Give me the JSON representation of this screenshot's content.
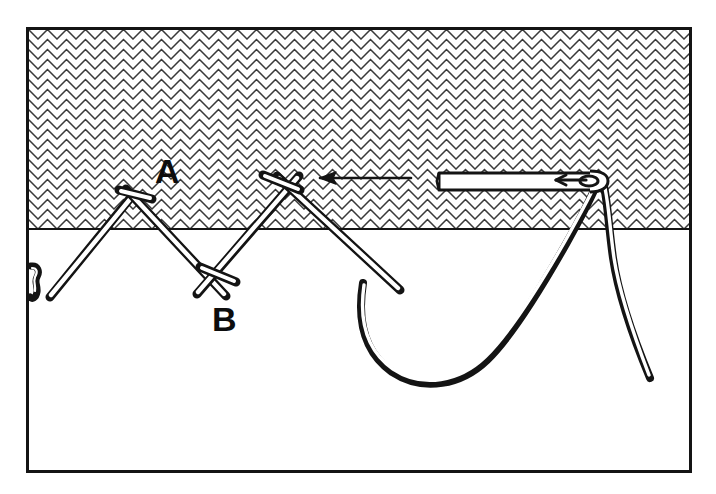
{
  "page": {
    "running_head": "STITCHES",
    "background_color": "#ffffff",
    "ink_color": "#141414",
    "rule_color": "#9a9a9a"
  },
  "figure": {
    "frame": {
      "x": 26,
      "y": 27,
      "width": 666,
      "height": 446,
      "stroke_color": "#141414",
      "stroke_width": 3
    },
    "fabric": {
      "name": "fabric-hatching",
      "description": "chevron hatched fabric panel",
      "x": 26,
      "y": 27,
      "width": 666,
      "height": 202,
      "edge_line_y": 229,
      "pattern": {
        "type": "chevron",
        "cell_width": 19,
        "cell_height": 10,
        "stroke_color": "#3a3a3a"
      }
    },
    "labels": [
      {
        "name": "label-a",
        "text": "A",
        "x": 155,
        "y": 183
      },
      {
        "name": "label-b",
        "text": "B",
        "x": 212,
        "y": 331
      }
    ],
    "direction_arrow": {
      "name": "direction-arrow",
      "description": "arrow showing working direction, right to left",
      "from_x": 411,
      "to_x": 318,
      "y": 178
    },
    "needle": {
      "name": "sewing-needle",
      "tip_x": 437,
      "eye_x": 605,
      "y": 180,
      "description": "needle lying in the fabric with thread through the eye"
    },
    "threads": [
      {
        "name": "stitch-leg-1",
        "description": "first zigzag stitch leg"
      },
      {
        "name": "stitch-leg-2",
        "description": "second zigzag stitch leg"
      },
      {
        "name": "stitch-crossbar-a",
        "description": "short crossing bar at A"
      },
      {
        "name": "stitch-crossbar-b",
        "description": "short crossing bar at B"
      },
      {
        "name": "working-thread-loop",
        "description": "slack working thread loop below the fabric"
      },
      {
        "name": "thread-tail",
        "description": "loose thread tail hanging at the right"
      },
      {
        "name": "thread-knot",
        "description": "small knot at the left edge"
      }
    ]
  }
}
